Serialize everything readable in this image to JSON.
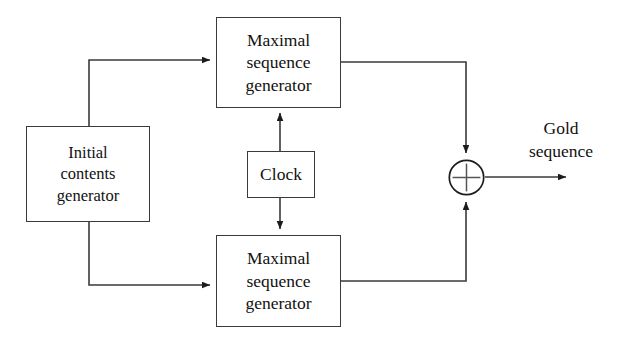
{
  "diagram": {
    "background_color": "#ffffff",
    "line_color": "#3a3a3a",
    "text_color": "#111111",
    "blocks": {
      "msg_top": {
        "name": "Maximal sequence generator",
        "line1": "Maximal",
        "line2": "sequence",
        "line3": "generator"
      },
      "msg_bottom": {
        "name": "Maximal sequence generator",
        "line1": "Maximal",
        "line2": "sequence",
        "line3": "generator"
      },
      "initial": {
        "name": "Initial contents generator",
        "line1": "Initial",
        "line2": "contents",
        "line3": "generator"
      },
      "clock": {
        "name": "Clock",
        "line1": "Clock"
      }
    },
    "operator": {
      "symbol": "+",
      "name": "modulo-2 adder"
    },
    "output": {
      "line1": "Gold",
      "line2": "sequence"
    }
  }
}
